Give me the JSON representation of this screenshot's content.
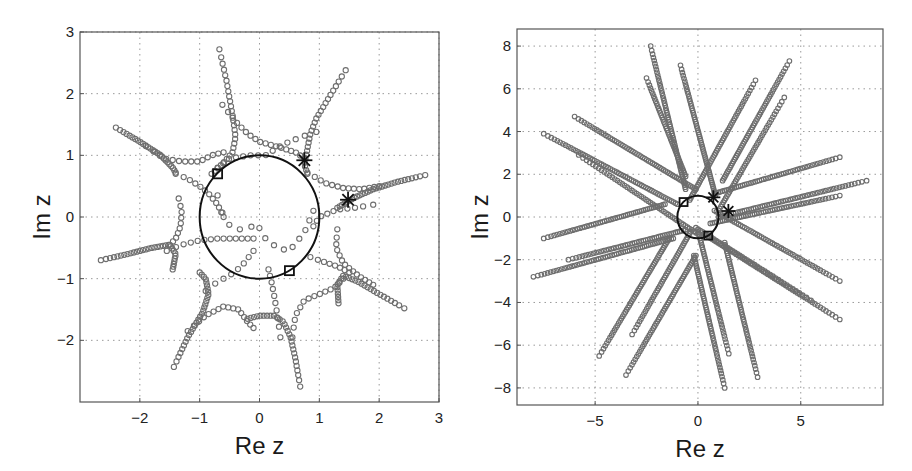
{
  "chart_data": [
    {
      "type": "scatter",
      "title": "",
      "xlabel": "Re z",
      "ylabel": "Im z",
      "xlim": [
        -3,
        3
      ],
      "ylim": [
        -3,
        3
      ],
      "xticks": [
        -2,
        -1,
        0,
        1,
        2,
        3
      ],
      "yticks": [
        -2,
        -1,
        0,
        1,
        2,
        3
      ],
      "xtick_labels": [
        "−2",
        "−1",
        "0",
        "1",
        "2",
        "3"
      ],
      "ytick_labels": [
        "−2",
        "−1",
        "0",
        "1",
        "2",
        "3"
      ],
      "grid": true,
      "frame_px": {
        "x0": 80,
        "x1": 439,
        "y0": 32,
        "y1": 402
      },
      "unit_circle": {
        "center": [
          0,
          0
        ],
        "radius": 1
      },
      "square_markers": [
        [
          -0.7,
          0.7
        ],
        [
          0.5,
          -0.87
        ]
      ],
      "star_markers": [
        [
          0.75,
          0.92
        ],
        [
          1.48,
          0.28
        ]
      ],
      "series": [
        {
          "name": "arm-top-left-upper",
          "points": [
            [
              -0.67,
              2.72
            ],
            [
              -0.55,
              2.2
            ],
            [
              -0.45,
              1.65
            ],
            [
              -0.4,
              1.3
            ],
            [
              -0.45,
              1.05
            ],
            [
              -0.6,
              0.88
            ],
            [
              -0.8,
              0.7
            ]
          ],
          "n": 28
        },
        {
          "name": "arm-top-left-curve",
          "points": [
            [
              -0.62,
              1.82
            ],
            [
              -0.4,
              1.55
            ],
            [
              -0.2,
              1.35
            ],
            [
              0.0,
              1.22
            ],
            [
              0.3,
              1.14
            ],
            [
              0.6,
              1.05
            ],
            [
              0.75,
              0.95
            ]
          ],
          "n": 18
        },
        {
          "name": "arm-top-right",
          "points": [
            [
              1.44,
              2.38
            ],
            [
              1.2,
              2.0
            ],
            [
              0.95,
              1.6
            ],
            [
              0.85,
              1.35
            ],
            [
              0.8,
              1.1
            ],
            [
              0.75,
              0.85
            ],
            [
              0.8,
              0.7
            ]
          ],
          "n": 26
        },
        {
          "name": "arm-top-right-curve",
          "points": [
            [
              0.95,
              1.38
            ],
            [
              0.7,
              1.3
            ],
            [
              0.4,
              1.18
            ],
            [
              0.1,
              1.0
            ],
            [
              -0.15,
              1.0
            ],
            [
              -0.5,
              0.95
            ],
            [
              -0.7,
              0.8
            ]
          ],
          "n": 14
        },
        {
          "name": "arm-upper-left",
          "points": [
            [
              -2.4,
              1.45
            ],
            [
              -2.0,
              1.22
            ],
            [
              -1.65,
              1.0
            ],
            [
              -1.45,
              0.8
            ],
            [
              -1.4,
              0.72
            ]
          ],
          "n": 26
        },
        {
          "name": "arm-upper-left-curve",
          "points": [
            [
              -1.9,
              1.15
            ],
            [
              -1.6,
              0.95
            ],
            [
              -1.3,
              0.9
            ],
            [
              -1.0,
              0.9
            ],
            [
              -0.8,
              1.0
            ],
            [
              -0.6,
              1.05
            ]
          ],
          "n": 14
        },
        {
          "name": "arm-upper-left-inner",
          "points": [
            [
              -1.4,
              0.7
            ],
            [
              -1.2,
              0.62
            ],
            [
              -1.0,
              0.5
            ],
            [
              -0.85,
              0.38
            ],
            [
              -0.7,
              0.2
            ],
            [
              -0.6,
              0.0
            ]
          ],
          "n": 12
        },
        {
          "name": "arm-right",
          "points": [
            [
              2.77,
              0.68
            ],
            [
              2.3,
              0.57
            ],
            [
              1.9,
              0.45
            ],
            [
              1.6,
              0.32
            ],
            [
              1.3,
              0.15
            ]
          ],
          "n": 30
        },
        {
          "name": "arm-right-curve",
          "points": [
            [
              0.8,
              0.72
            ],
            [
              1.1,
              0.55
            ],
            [
              1.4,
              0.47
            ],
            [
              1.7,
              0.45
            ],
            [
              2.0,
              0.5
            ]
          ],
          "n": 14
        },
        {
          "name": "arm-right-inner",
          "points": [
            [
              1.9,
              0.2
            ],
            [
              1.6,
              0.15
            ],
            [
              1.3,
              0.12
            ],
            [
              1.0,
              0.0
            ],
            [
              0.9,
              -0.15
            ]
          ],
          "n": 10
        },
        {
          "name": "arm-left-lower",
          "points": [
            [
              -2.65,
              -0.7
            ],
            [
              -2.2,
              -0.6
            ],
            [
              -1.8,
              -0.5
            ],
            [
              -1.5,
              -0.45
            ],
            [
              -1.4,
              -0.6
            ],
            [
              -1.45,
              -0.85
            ]
          ],
          "n": 32
        },
        {
          "name": "arm-left-lower-curve",
          "points": [
            [
              -1.55,
              -0.55
            ],
            [
              -1.3,
              -0.45
            ],
            [
              -1.0,
              -0.38
            ],
            [
              -0.7,
              -0.35
            ],
            [
              -0.4,
              -0.35
            ],
            [
              -0.1,
              -0.35
            ]
          ],
          "n": 14
        },
        {
          "name": "arm-left-inner-vertical",
          "points": [
            [
              -1.35,
              0.3
            ],
            [
              -1.3,
              0.1
            ],
            [
              -1.32,
              -0.15
            ],
            [
              -1.4,
              -0.35
            ],
            [
              -1.5,
              -0.45
            ]
          ],
          "n": 10
        },
        {
          "name": "arm-lower-left",
          "points": [
            [
              -1.43,
              -2.43
            ],
            [
              -1.2,
              -1.95
            ],
            [
              -0.95,
              -1.55
            ],
            [
              -0.85,
              -1.25
            ],
            [
              -0.9,
              -1.0
            ],
            [
              -1.0,
              -0.9
            ]
          ],
          "n": 30
        },
        {
          "name": "arm-lower-left-curve",
          "points": [
            [
              -1.2,
              -1.85
            ],
            [
              -0.9,
              -1.6
            ],
            [
              -0.6,
              -1.45
            ],
            [
              -0.35,
              -1.5
            ],
            [
              -0.2,
              -1.7
            ],
            [
              -0.1,
              -1.8
            ]
          ],
          "n": 16
        },
        {
          "name": "arm-lower-left-inner",
          "points": [
            [
              -0.9,
              -1.2
            ],
            [
              -0.7,
              -1.05
            ],
            [
              -0.5,
              -0.95
            ],
            [
              -0.3,
              -0.8
            ],
            [
              -0.1,
              -0.55
            ]
          ],
          "n": 8
        },
        {
          "name": "arm-bottom",
          "points": [
            [
              0.68,
              -2.75
            ],
            [
              0.6,
              -2.3
            ],
            [
              0.52,
              -1.95
            ],
            [
              0.4,
              -1.7
            ],
            [
              0.25,
              -1.6
            ],
            [
              0.0,
              -1.6
            ],
            [
              -0.2,
              -1.65
            ]
          ],
          "n": 28
        },
        {
          "name": "arm-bottom-inner",
          "points": [
            [
              0.35,
              -1.95
            ],
            [
              0.3,
              -1.6
            ],
            [
              0.25,
              -1.3
            ],
            [
              0.2,
              -1.05
            ],
            [
              0.15,
              -0.85
            ]
          ],
          "n": 10
        },
        {
          "name": "arm-bottom-right-curve",
          "points": [
            [
              0.55,
              -1.95
            ],
            [
              0.6,
              -1.6
            ],
            [
              0.75,
              -1.35
            ],
            [
              1.0,
              -1.25
            ],
            [
              1.25,
              -1.15
            ],
            [
              1.4,
              -1.0
            ]
          ],
          "n": 14
        },
        {
          "name": "arm-lower-right",
          "points": [
            [
              2.42,
              -1.48
            ],
            [
              2.0,
              -1.25
            ],
            [
              1.65,
              -1.05
            ],
            [
              1.4,
              -0.95
            ],
            [
              1.3,
              -1.1
            ],
            [
              1.32,
              -1.4
            ]
          ],
          "n": 28
        },
        {
          "name": "arm-lower-right-curve",
          "points": [
            [
              1.3,
              -0.2
            ],
            [
              1.28,
              -0.5
            ],
            [
              1.4,
              -0.75
            ],
            [
              1.65,
              -0.95
            ],
            [
              1.9,
              -1.1
            ]
          ],
          "n": 14
        },
        {
          "name": "arm-lower-right-inner",
          "points": [
            [
              0.85,
              -0.65
            ],
            [
              1.05,
              -0.72
            ],
            [
              1.3,
              -0.8
            ],
            [
              1.5,
              -0.9
            ]
          ],
          "n": 8
        },
        {
          "name": "interior-scatter",
          "points": [
            [
              -0.7,
              0.35
            ],
            [
              -0.6,
              0.0
            ],
            [
              -0.45,
              -0.2
            ],
            [
              -0.2,
              -0.2
            ],
            [
              -0.05,
              -0.1
            ],
            [
              0.1,
              -0.35
            ],
            [
              0.3,
              -0.5
            ],
            [
              0.5,
              -0.55
            ],
            [
              0.75,
              -0.25
            ],
            [
              0.9,
              0.1
            ]
          ],
          "n": 14
        }
      ]
    },
    {
      "type": "scatter",
      "title": "",
      "xlabel": "Re z",
      "ylabel": "Im z",
      "xlim": [
        -8.8,
        9
      ],
      "ylim": [
        -8.8,
        8.8
      ],
      "xticks": [
        -5,
        0,
        5
      ],
      "yticks": [
        -8,
        -6,
        -4,
        -2,
        0,
        2,
        4,
        6,
        8
      ],
      "xtick_labels": [
        "−5",
        "0",
        "5"
      ],
      "ytick_labels": [
        "−8",
        "−6",
        "−4",
        "−2",
        "0",
        "2",
        "4",
        "6",
        "8"
      ],
      "grid": true,
      "frame_px": {
        "x0": 517,
        "x1": 883,
        "y0": 29,
        "y1": 405
      },
      "unit_circle": {
        "center": [
          0,
          0
        ],
        "radius": 1
      },
      "square_markers": [
        [
          -0.7,
          0.7
        ],
        [
          0.5,
          -0.87
        ]
      ],
      "star_markers": [
        [
          0.75,
          0.92
        ],
        [
          1.48,
          0.28
        ]
      ],
      "series": [
        {
          "name": "ray-1",
          "points": [
            [
              -2.3,
              8.0
            ],
            [
              -0.6,
              1.3
            ]
          ],
          "n": 60
        },
        {
          "name": "ray-2",
          "points": [
            [
              -0.85,
              7.1
            ],
            [
              0.85,
              1.0
            ]
          ],
          "n": 60
        },
        {
          "name": "ray-3",
          "points": [
            [
              -2.5,
              6.5
            ],
            [
              -0.6,
              1.9
            ]
          ],
          "n": 45
        },
        {
          "name": "ray-4",
          "points": [
            [
              2.8,
              6.4
            ],
            [
              -0.4,
              0.8
            ]
          ],
          "n": 55
        },
        {
          "name": "ray-5",
          "points": [
            [
              4.45,
              7.3
            ],
            [
              1.2,
              1.7
            ]
          ],
          "n": 55
        },
        {
          "name": "ray-6",
          "points": [
            [
              4.2,
              5.6
            ],
            [
              1.0,
              0.3
            ]
          ],
          "n": 48
        },
        {
          "name": "ray-7",
          "points": [
            [
              -6.0,
              4.7
            ],
            [
              -0.1,
              1.3
            ]
          ],
          "n": 60
        },
        {
          "name": "ray-8",
          "points": [
            [
              -7.5,
              3.9
            ],
            [
              -1.0,
              0.6
            ]
          ],
          "n": 60
        },
        {
          "name": "ray-9",
          "points": [
            [
              6.9,
              2.8
            ],
            [
              0.8,
              1.1
            ]
          ],
          "n": 55
        },
        {
          "name": "ray-10",
          "points": [
            [
              8.2,
              1.7
            ],
            [
              1.0,
              0.0
            ]
          ],
          "n": 60
        },
        {
          "name": "ray-11",
          "points": [
            [
              6.9,
              1.0
            ],
            [
              0.6,
              -0.3
            ]
          ],
          "n": 55
        },
        {
          "name": "ray-12",
          "points": [
            [
              -7.5,
              -1.0
            ],
            [
              -1.6,
              0.6
            ]
          ],
          "n": 55
        },
        {
          "name": "ray-13",
          "points": [
            [
              -6.3,
              -2.0
            ],
            [
              -0.6,
              -0.6
            ]
          ],
          "n": 50
        },
        {
          "name": "ray-14",
          "points": [
            [
              -8.0,
              -2.8
            ],
            [
              -1.2,
              -1.0
            ]
          ],
          "n": 60
        },
        {
          "name": "ray-15",
          "points": [
            [
              6.9,
              -3.0
            ],
            [
              0.8,
              0.3
            ]
          ],
          "n": 55
        },
        {
          "name": "ray-16",
          "points": [
            [
              6.9,
              -4.8
            ],
            [
              0.3,
              -0.8
            ]
          ],
          "n": 60
        },
        {
          "name": "ray-17",
          "points": [
            [
              5.5,
              -3.9
            ],
            [
              -0.1,
              -0.5
            ]
          ],
          "n": 45
        },
        {
          "name": "ray-18",
          "points": [
            [
              -4.8,
              -6.5
            ],
            [
              -1.4,
              -1.0
            ]
          ],
          "n": 55
        },
        {
          "name": "ray-19",
          "points": [
            [
              -3.2,
              -5.5
            ],
            [
              -0.3,
              -0.6
            ]
          ],
          "n": 48
        },
        {
          "name": "ray-20",
          "points": [
            [
              -3.5,
              -7.4
            ],
            [
              -0.1,
              -1.8
            ]
          ],
          "n": 55
        },
        {
          "name": "ray-21",
          "points": [
            [
              1.3,
              -8.0
            ],
            [
              -0.2,
              -1.8
            ]
          ],
          "n": 55
        },
        {
          "name": "ray-22",
          "points": [
            [
              1.5,
              -6.4
            ],
            [
              0.0,
              -0.6
            ]
          ],
          "n": 50
        },
        {
          "name": "ray-23",
          "points": [
            [
              2.9,
              -7.5
            ],
            [
              1.3,
              -1.2
            ]
          ],
          "n": 55
        },
        {
          "name": "ray-24",
          "points": [
            [
              -5.8,
              2.9
            ],
            [
              0.0,
              -0.8
            ]
          ],
          "n": 50
        }
      ]
    }
  ],
  "colors": {
    "marker_stroke": "#6e6e6e",
    "circle_stroke": "#111111",
    "frame": "#555555",
    "grid": "#9a9a9a",
    "text": "#1a1a1a"
  }
}
